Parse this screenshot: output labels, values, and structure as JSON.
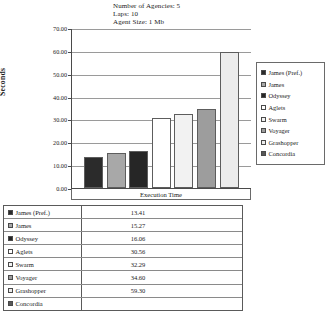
{
  "header": {
    "lines": [
      "Number of Agencies: 5",
      "Laps: 10",
      "Agent Size: 1 Mb"
    ],
    "line1": "Number of Agencies: 5",
    "line2": "Laps: 10",
    "line3": "Agent Size: 1 Mb"
  },
  "axis": {
    "y_title": "Seconds",
    "x_label": "Execution Time",
    "y_ticks": [
      "0.00",
      "10.00",
      "20.00",
      "30.00",
      "40.00",
      "50.00",
      "60.00",
      "70.00"
    ]
  },
  "legend": {
    "position": "right",
    "items": [
      {
        "label": "James (Pref.)",
        "color": "#2b2b2b"
      },
      {
        "label": "James",
        "color": "#a8a8a8"
      },
      {
        "label": "Odyssey",
        "color": "#262626"
      },
      {
        "label": "Aglets",
        "color": "#ffffff"
      },
      {
        "label": "Swarm",
        "color": "#f2f2f2"
      },
      {
        "label": "Voyager",
        "color": "#9d9d9d"
      },
      {
        "label": "Grashopper",
        "color": "#ececec"
      },
      {
        "label": "Concordia",
        "color": "#585858"
      }
    ]
  },
  "table": {
    "rows": [
      {
        "name": "James (Pref.)",
        "value": "13.41",
        "color": "#2b2b2b"
      },
      {
        "name": "James",
        "value": "15.27",
        "color": "#a8a8a8"
      },
      {
        "name": "Odyssey",
        "value": "16.06",
        "color": "#262626"
      },
      {
        "name": "Aglets",
        "value": "30.56",
        "color": "#ffffff"
      },
      {
        "name": "Swarm",
        "value": "32.29",
        "color": "#f2f2f2"
      },
      {
        "name": "Voyager",
        "value": "34.60",
        "color": "#9d9d9d"
      },
      {
        "name": "Grashopper",
        "value": "59.30",
        "color": "#ececec"
      },
      {
        "name": "Concordia",
        "value": "",
        "color": "#585858"
      }
    ]
  },
  "chart_data": {
    "type": "bar",
    "title": "",
    "subtitle": "Number of Agencies: 5 / Laps: 10 / Agent Size: 1 Mb",
    "categories": [
      "James (Pref.)",
      "James",
      "Odyssey",
      "Aglets",
      "Swarm",
      "Voyager",
      "Grashopper",
      "Concordia"
    ],
    "values": [
      13.41,
      15.27,
      16.06,
      30.56,
      32.29,
      34.6,
      59.3,
      null
    ],
    "xlabel": "Execution Time",
    "ylabel": "Seconds",
    "ylim": [
      0,
      70
    ],
    "ytick_step": 10,
    "ytick_labels": [
      "0.00",
      "10.00",
      "20.00",
      "30.00",
      "40.00",
      "50.00",
      "60.00",
      "70.00"
    ],
    "grid": true,
    "legend_position": "right",
    "series_colors": [
      "#2b2b2b",
      "#a8a8a8",
      "#262626",
      "#ffffff",
      "#f2f2f2",
      "#9d9d9d",
      "#ececec",
      "#585858"
    ]
  }
}
